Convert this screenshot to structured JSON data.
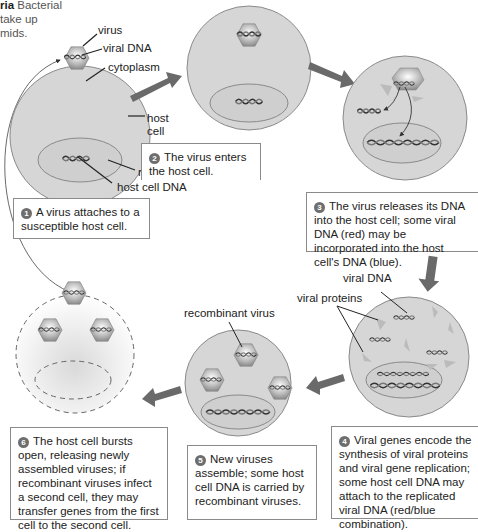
{
  "caption_fragment": {
    "bold": "ria",
    "lines": [
      " Bacterial",
      "take up",
      "mids."
    ]
  },
  "step1": {
    "number": "1",
    "text": "A virus attaches to a susceptible host cell.",
    "labels": {
      "virus": "virus",
      "viral_dna": "viral DNA",
      "cytoplasm": "cytoplasm",
      "host_cell_line1": "host",
      "host_cell_line2": "cell",
      "nucleus": "nucleus",
      "host_cell_dna": "host cell DNA"
    }
  },
  "step2": {
    "number": "2",
    "text": "The virus enters the host cell."
  },
  "step3": {
    "number": "3",
    "text": "The virus releases its DNA into the host cell; some viral DNA (red) may be incorporated into the host cell's DNA (blue)."
  },
  "step4": {
    "number": "4",
    "text": "Viral genes encode the synthesis of viral proteins and viral gene replication; some host cell DNA may attach to the replicated viral DNA (red/blue combination).",
    "labels": {
      "viral_dna": "viral DNA",
      "viral_proteins": "viral proteins"
    }
  },
  "step5": {
    "number": "5",
    "text": "New viruses assemble; some host cell DNA is carried by recombinant viruses.",
    "labels": {
      "recombinant_virus": "recombinant virus"
    }
  },
  "step6": {
    "number": "6",
    "text": "The host cell bursts open, releasing newly assembled viruses; if recombinant viruses infect a second cell, they may transfer genes from the first cell to the second cell."
  },
  "colors": {
    "cell_fill": "#d6d6d6",
    "cell_stroke": "#8a8a8a",
    "arrow": "#6a6a6a",
    "dna": "#333333",
    "box_border": "#8a8a8a"
  }
}
